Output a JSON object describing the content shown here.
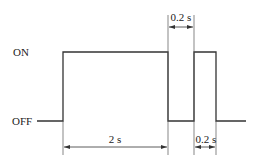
{
  "diagram": {
    "type": "timing-diagram",
    "levels": {
      "on_label": "ON",
      "off_label": "OFF"
    },
    "waveform": [
      {
        "state": "OFF",
        "x_start": 37,
        "x_end": 63
      },
      {
        "state": "ON",
        "x_start": 63,
        "x_end": 168
      },
      {
        "state": "OFF",
        "x_start": 168,
        "x_end": 194
      },
      {
        "state": "ON",
        "x_start": 194,
        "x_end": 216
      },
      {
        "state": "OFF",
        "x_start": 216,
        "x_end": 246
      }
    ],
    "dimensions": [
      {
        "label": "2 s",
        "from_x": 63,
        "to_x": 168,
        "position": "bottom"
      },
      {
        "label": "0.2 s",
        "from_x": 168,
        "to_x": 194,
        "position": "top"
      },
      {
        "label": "0.2 s",
        "from_x": 194,
        "to_x": 216,
        "position": "bottom"
      }
    ],
    "colors": {
      "line": "#333333",
      "text": "#222222",
      "background": "#ffffff"
    }
  }
}
